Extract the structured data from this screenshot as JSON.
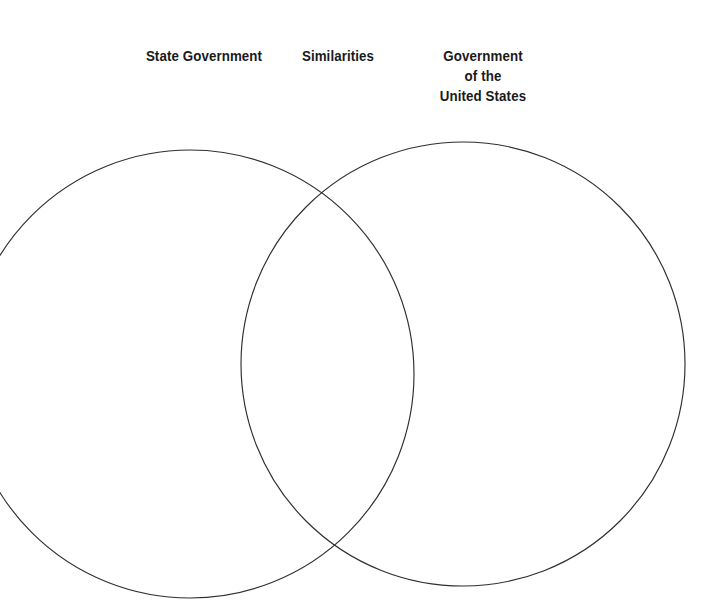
{
  "page": {
    "background_color": "#ffffff",
    "width": 721,
    "height": 613
  },
  "labels": {
    "left": "State Government",
    "middle": "Similarities",
    "right": "Government\nof the\nUnited States"
  },
  "diagram": {
    "type": "venn",
    "stroke_color": "#2e2e33",
    "fill_color": "none",
    "text_color": "#1a1a1a",
    "circles": [
      {
        "name": "state-government-circle",
        "cx": 190,
        "cy": 374,
        "r": 224,
        "label": "State Government"
      },
      {
        "name": "united-states-government-circle",
        "cx": 463,
        "cy": 364,
        "r": 222,
        "label": "Government of the United States"
      }
    ],
    "overlap_label": "Similarities"
  }
}
